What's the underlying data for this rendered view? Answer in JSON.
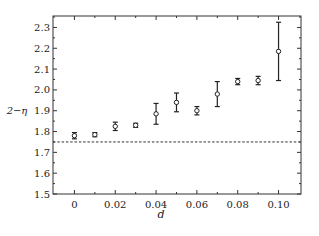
{
  "chart_data": {
    "type": "scatter",
    "title": "",
    "xlabel": "d",
    "ylabel": "2−η",
    "xlim": [
      -0.0105,
      0.111
    ],
    "ylim": [
      1.5,
      2.355
    ],
    "xticks": [
      0,
      0.02,
      0.04,
      0.06,
      0.08,
      0.1
    ],
    "xtick_labels": [
      "0",
      "0.02",
      "0.04",
      "0.06",
      "0.08",
      "0.10"
    ],
    "yticks": [
      1.5,
      1.6,
      1.7,
      1.8,
      1.9,
      2.0,
      2.1,
      2.2,
      2.3
    ],
    "ytick_labels": [
      "1.5",
      "1.6",
      "1.7",
      "1.8",
      "1.9",
      "2.0",
      "2.1",
      "2.2",
      "2.3"
    ],
    "grid": false,
    "legend": null,
    "series": [
      {
        "name": "2−η vs d",
        "marker": "open-circle",
        "error_bars": true,
        "x": [
          0,
          0.01,
          0.02,
          0.03,
          0.04,
          0.05,
          0.06,
          0.07,
          0.08,
          0.09,
          0.1
        ],
        "y": [
          1.78,
          1.785,
          1.825,
          1.83,
          1.885,
          1.94,
          1.9,
          1.98,
          2.04,
          2.045,
          2.185
        ],
        "yerr": [
          0.015,
          0.01,
          0.02,
          0.01,
          0.05,
          0.045,
          0.02,
          0.06,
          0.015,
          0.02,
          0.14
        ]
      }
    ],
    "reference_lines": [
      {
        "orientation": "horizontal",
        "y": 1.75,
        "style": "dashed"
      }
    ]
  }
}
